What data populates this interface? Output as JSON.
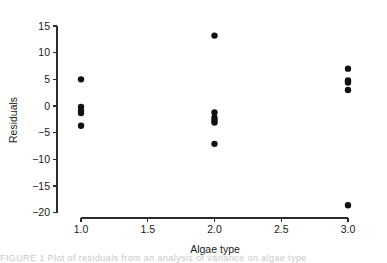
{
  "figure": {
    "background_color": "#ffffff",
    "axis_color": "#2b2b2b",
    "point_color": "#111111",
    "caption_fragment": "FIGURE 1   Plot of residuals from an analysis of variance on algae type"
  },
  "chart_data": {
    "type": "scatter",
    "title": "",
    "xlabel": "Algae type",
    "ylabel": "Residuals",
    "xlim": [
      0.82,
      3.18
    ],
    "ylim": [
      -21.0,
      16.5
    ],
    "xticks": [
      1.0,
      1.5,
      2.0,
      2.5,
      3.0
    ],
    "xtick_labels": [
      "1.0",
      "1.5",
      "2.0",
      "2.5",
      "3.0"
    ],
    "yticks": [
      15,
      10,
      5,
      0,
      -5,
      -10,
      -15,
      -20
    ],
    "ytick_labels": [
      "15",
      "10",
      "5",
      "0",
      "−5",
      "−10",
      "−15",
      "−20"
    ],
    "grid": false,
    "legend": false,
    "marker": "filled-circle",
    "marker_size": 3.2,
    "points": [
      {
        "x": 1.0,
        "y": 5.0
      },
      {
        "x": 1.0,
        "y": -0.2
      },
      {
        "x": 1.0,
        "y": -0.9
      },
      {
        "x": 1.0,
        "y": -1.3
      },
      {
        "x": 1.0,
        "y": -3.7
      },
      {
        "x": 2.0,
        "y": 13.2
      },
      {
        "x": 2.0,
        "y": -1.2
      },
      {
        "x": 2.0,
        "y": -2.2
      },
      {
        "x": 2.0,
        "y": -2.7
      },
      {
        "x": 2.0,
        "y": -3.1
      },
      {
        "x": 2.0,
        "y": -7.1
      },
      {
        "x": 3.0,
        "y": 7.0
      },
      {
        "x": 3.0,
        "y": 4.8
      },
      {
        "x": 3.0,
        "y": 4.4
      },
      {
        "x": 3.0,
        "y": 3.0
      },
      {
        "x": 3.0,
        "y": -18.6
      }
    ]
  }
}
